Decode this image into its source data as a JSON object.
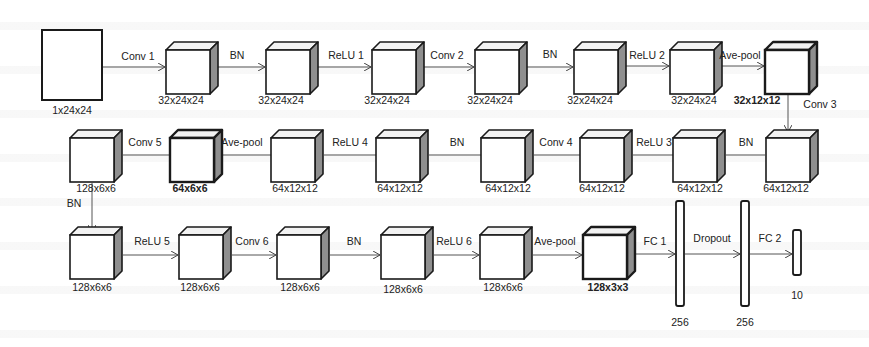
{
  "diagram": {
    "input": {
      "label": "1x24x24",
      "x": 42,
      "y": 30,
      "w": 60,
      "h": 70
    },
    "cubes": [
      {
        "id": "c1",
        "x": 166,
        "y": 42,
        "label": "32x24x24",
        "lx": 181,
        "ly": 104,
        "bold": false
      },
      {
        "id": "c2",
        "x": 266,
        "y": 42,
        "label": "32x24x24",
        "lx": 281,
        "ly": 104,
        "bold": false
      },
      {
        "id": "c3",
        "x": 372,
        "y": 42,
        "label": "32x24x24",
        "lx": 387,
        "ly": 104,
        "bold": false
      },
      {
        "id": "c4",
        "x": 475,
        "y": 42,
        "label": "32x24x24",
        "lx": 490,
        "ly": 104,
        "bold": false
      },
      {
        "id": "c5",
        "x": 574,
        "y": 42,
        "label": "32x24x24",
        "lx": 590,
        "ly": 104,
        "bold": false
      },
      {
        "id": "c6",
        "x": 670,
        "y": 42,
        "label": "32x24x24",
        "lx": 694,
        "ly": 104,
        "bold": false
      },
      {
        "id": "c7",
        "x": 765,
        "y": 42,
        "label": "32x12x12",
        "lx": 757,
        "ly": 104,
        "bold": true
      },
      {
        "id": "c8",
        "x": 766,
        "y": 130,
        "label": "64x12x12",
        "lx": 786,
        "ly": 192,
        "bold": false
      },
      {
        "id": "c9",
        "x": 673,
        "y": 130,
        "label": "64x12x12",
        "lx": 700,
        "ly": 192,
        "bold": false
      },
      {
        "id": "c10",
        "x": 580,
        "y": 130,
        "label": "64x12x12",
        "lx": 602,
        "ly": 192,
        "bold": false
      },
      {
        "id": "c11",
        "x": 481,
        "y": 130,
        "label": "64x12x12",
        "lx": 508,
        "ly": 192,
        "bold": false
      },
      {
        "id": "c12",
        "x": 376,
        "y": 130,
        "label": "64x12x12",
        "lx": 400,
        "ly": 192,
        "bold": false
      },
      {
        "id": "c13",
        "x": 271,
        "y": 130,
        "label": "64x12x12",
        "lx": 295,
        "ly": 192,
        "bold": false
      },
      {
        "id": "c14",
        "x": 170,
        "y": 130,
        "label": "64x6x6",
        "lx": 190,
        "ly": 192,
        "bold": true
      },
      {
        "id": "c15",
        "x": 70,
        "y": 130,
        "label": "128x6x6",
        "lx": 96,
        "ly": 192,
        "bold": false
      },
      {
        "id": "c16",
        "x": 70,
        "y": 227,
        "label": "128x6x6",
        "lx": 92,
        "ly": 291,
        "bold": false
      },
      {
        "id": "c17",
        "x": 179,
        "y": 227,
        "label": "128x6x6",
        "lx": 200,
        "ly": 291,
        "bold": false
      },
      {
        "id": "c18",
        "x": 277,
        "y": 227,
        "label": "128x6x6",
        "lx": 300,
        "ly": 291,
        "bold": false
      },
      {
        "id": "c19",
        "x": 381,
        "y": 227,
        "label": "128x6x6",
        "lx": 403,
        "ly": 293,
        "bold": false
      },
      {
        "id": "c20",
        "x": 480,
        "y": 227,
        "label": "128x6x6",
        "lx": 503,
        "ly": 291,
        "bold": false
      },
      {
        "id": "c21",
        "x": 583,
        "y": 227,
        "label": "128x3x3",
        "lx": 608,
        "ly": 291,
        "bold": true
      }
    ],
    "cube_size": {
      "w": 44,
      "h": 44,
      "depth": 8
    },
    "fc_layers": [
      {
        "id": "fc1",
        "x": 676,
        "y": 201,
        "w": 8,
        "h": 105,
        "label": "256",
        "lx": 680,
        "ly": 326
      },
      {
        "id": "fc2",
        "x": 741,
        "y": 201,
        "w": 8,
        "h": 105,
        "label": "256",
        "lx": 745,
        "ly": 326
      },
      {
        "id": "out",
        "x": 793,
        "y": 230,
        "w": 8,
        "h": 45,
        "label": "10",
        "lx": 797,
        "ly": 299
      }
    ],
    "edges": [
      {
        "label": "Conv 1",
        "x1": 103,
        "y1": 67,
        "x2": 165,
        "y2": 67,
        "lx": 138,
        "ly": 60,
        "arrow": true
      },
      {
        "label": "BN",
        "x1": 218,
        "y1": 67,
        "x2": 265,
        "y2": 67,
        "lx": 237,
        "ly": 59,
        "arrow": true
      },
      {
        "label": "ReLU 1",
        "x1": 318,
        "y1": 67,
        "x2": 371,
        "y2": 67,
        "lx": 346,
        "ly": 59,
        "arrow": true
      },
      {
        "label": "Conv 2",
        "x1": 424,
        "y1": 67,
        "x2": 474,
        "y2": 67,
        "lx": 447,
        "ly": 59,
        "arrow": true
      },
      {
        "label": "BN",
        "x1": 527,
        "y1": 67,
        "x2": 573,
        "y2": 67,
        "lx": 550,
        "ly": 58,
        "arrow": true
      },
      {
        "label": "ReLU 2",
        "x1": 626,
        "y1": 66,
        "x2": 669,
        "y2": 66,
        "lx": 647,
        "ly": 59,
        "arrow": true
      },
      {
        "label": "Ave-pool",
        "x1": 722,
        "y1": 66,
        "x2": 764,
        "y2": 66,
        "lx": 740,
        "ly": 59,
        "arrow": true
      },
      {
        "label": "Conv 3",
        "x1": 788,
        "y1": 95,
        "x2": 788,
        "y2": 132,
        "lx": 820,
        "ly": 108,
        "arrow": true
      },
      {
        "label": "BN",
        "x1": 765,
        "y1": 155,
        "x2": 726,
        "y2": 155,
        "lx": 746,
        "ly": 146,
        "arrow": false
      },
      {
        "label": "ReLU 3",
        "x1": 673,
        "y1": 155,
        "x2": 633,
        "y2": 155,
        "lx": 654,
        "ly": 146,
        "arrow": false
      },
      {
        "label": "Conv 4",
        "x1": 580,
        "y1": 155,
        "x2": 534,
        "y2": 155,
        "lx": 556,
        "ly": 146,
        "arrow": false
      },
      {
        "label": "BN",
        "x1": 481,
        "y1": 155,
        "x2": 429,
        "y2": 155,
        "lx": 457,
        "ly": 146,
        "arrow": false
      },
      {
        "label": "ReLU 4",
        "x1": 376,
        "y1": 155,
        "x2": 324,
        "y2": 155,
        "lx": 350,
        "ly": 146,
        "arrow": false
      },
      {
        "label": "Ave-pool",
        "x1": 271,
        "y1": 155,
        "x2": 223,
        "y2": 155,
        "lx": 242,
        "ly": 146,
        "arrow": false
      },
      {
        "label": "Conv 5",
        "x1": 170,
        "y1": 155,
        "x2": 123,
        "y2": 155,
        "lx": 145,
        "ly": 146,
        "arrow": false
      },
      {
        "label": "BN",
        "x1": 92,
        "y1": 183,
        "x2": 92,
        "y2": 232,
        "lx": 74,
        "ly": 207,
        "arrow": true
      },
      {
        "label": "ReLU 5",
        "x1": 123,
        "y1": 255,
        "x2": 178,
        "y2": 255,
        "lx": 152,
        "ly": 245,
        "arrow": true
      },
      {
        "label": "Conv 6",
        "x1": 232,
        "y1": 255,
        "x2": 276,
        "y2": 255,
        "lx": 252,
        "ly": 245,
        "arrow": true
      },
      {
        "label": "BN",
        "x1": 330,
        "y1": 255,
        "x2": 380,
        "y2": 255,
        "lx": 354,
        "ly": 245,
        "arrow": true
      },
      {
        "label": "ReLU 6",
        "x1": 434,
        "y1": 255,
        "x2": 479,
        "y2": 255,
        "lx": 454,
        "ly": 245,
        "arrow": true
      },
      {
        "label": "Ave-pool",
        "x1": 533,
        "y1": 255,
        "x2": 582,
        "y2": 255,
        "lx": 555,
        "ly": 245,
        "arrow": true
      },
      {
        "label": "FC 1",
        "x1": 635,
        "y1": 254,
        "x2": 675,
        "y2": 254,
        "lx": 655,
        "ly": 245,
        "arrow": true
      },
      {
        "label": "Dropout",
        "x1": 685,
        "y1": 254,
        "x2": 740,
        "y2": 254,
        "lx": 712,
        "ly": 242,
        "arrow": true
      },
      {
        "label": "FC 2",
        "x1": 750,
        "y1": 254,
        "x2": 792,
        "y2": 254,
        "lx": 770,
        "ly": 242,
        "arrow": true
      }
    ],
    "colors": {
      "stroke": "#1a1a1a",
      "face": "#ffffff",
      "side": "#8f8f8f",
      "top": "#f2f2f2",
      "edge": "#555555",
      "background": "#ffffff"
    }
  }
}
